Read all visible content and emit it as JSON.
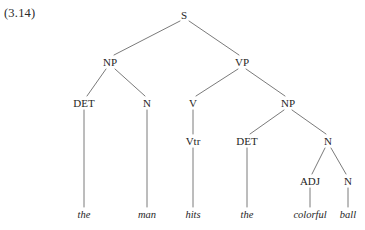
{
  "figure": {
    "example_number": "(3.14)",
    "sentence": "the man hits the colorful ball",
    "line_color": "#6b6b6b",
    "text_color": "#262626",
    "background_color": "#ffffff"
  },
  "nodes": {
    "s": {
      "label": "S",
      "x": 184,
      "y": 15
    },
    "np_subj": {
      "label": "NP",
      "x": 110,
      "y": 62
    },
    "vp": {
      "label": "VP",
      "x": 242,
      "y": 62
    },
    "det1": {
      "label": "DET",
      "x": 84,
      "y": 103
    },
    "n1": {
      "label": "N",
      "x": 147,
      "y": 103
    },
    "v": {
      "label": "V",
      "x": 193,
      "y": 103
    },
    "np_obj": {
      "label": "NP",
      "x": 288,
      "y": 103
    },
    "vtr": {
      "label": "Vtr",
      "x": 193,
      "y": 141
    },
    "det2": {
      "label": "DET",
      "x": 247,
      "y": 141
    },
    "n2": {
      "label": "N",
      "x": 328,
      "y": 141
    },
    "adj": {
      "label": "ADJ",
      "x": 310,
      "y": 181
    },
    "n3": {
      "label": "N",
      "x": 348,
      "y": 181
    }
  },
  "leaves": {
    "the1": {
      "label": "the",
      "x": 84,
      "y": 215
    },
    "man": {
      "label": "man",
      "x": 147,
      "y": 215
    },
    "hits": {
      "label": "hits",
      "x": 193,
      "y": 215
    },
    "the2": {
      "label": "the",
      "x": 247,
      "y": 215
    },
    "colorful": {
      "label": "colorful",
      "x": 310,
      "y": 215
    },
    "ball": {
      "label": "ball",
      "x": 348,
      "y": 215
    }
  },
  "edges": [
    {
      "name": "edge-s-np",
      "x1": 180,
      "y1": 21,
      "x2": 114,
      "y2": 55
    },
    {
      "name": "edge-s-vp",
      "x1": 189,
      "y1": 21,
      "x2": 239,
      "y2": 55
    },
    {
      "name": "edge-np-det",
      "x1": 106,
      "y1": 69,
      "x2": 87,
      "y2": 96
    },
    {
      "name": "edge-np-n",
      "x1": 115,
      "y1": 69,
      "x2": 145,
      "y2": 96
    },
    {
      "name": "edge-vp-v",
      "x1": 238,
      "y1": 69,
      "x2": 196,
      "y2": 96
    },
    {
      "name": "edge-vp-np",
      "x1": 246,
      "y1": 69,
      "x2": 285,
      "y2": 96
    },
    {
      "name": "edge-det1-the",
      "x1": 84,
      "y1": 110,
      "x2": 84,
      "y2": 207
    },
    {
      "name": "edge-n1-man",
      "x1": 147,
      "y1": 110,
      "x2": 147,
      "y2": 207
    },
    {
      "name": "edge-v-vtr",
      "x1": 193,
      "y1": 110,
      "x2": 193,
      "y2": 134
    },
    {
      "name": "edge-npobj-det2",
      "x1": 284,
      "y1": 110,
      "x2": 250,
      "y2": 134
    },
    {
      "name": "edge-npobj-n2",
      "x1": 292,
      "y1": 110,
      "x2": 326,
      "y2": 134
    },
    {
      "name": "edge-vtr-hits",
      "x1": 193,
      "y1": 148,
      "x2": 193,
      "y2": 207
    },
    {
      "name": "edge-det2-the",
      "x1": 247,
      "y1": 148,
      "x2": 247,
      "y2": 207
    },
    {
      "name": "edge-n2-adj",
      "x1": 325,
      "y1": 148,
      "x2": 312,
      "y2": 174
    },
    {
      "name": "edge-n2-n3",
      "x1": 331,
      "y1": 148,
      "x2": 346,
      "y2": 174
    },
    {
      "name": "edge-adj-colorful",
      "x1": 310,
      "y1": 188,
      "x2": 310,
      "y2": 207
    },
    {
      "name": "edge-n3-ball",
      "x1": 348,
      "y1": 188,
      "x2": 348,
      "y2": 207
    }
  ]
}
